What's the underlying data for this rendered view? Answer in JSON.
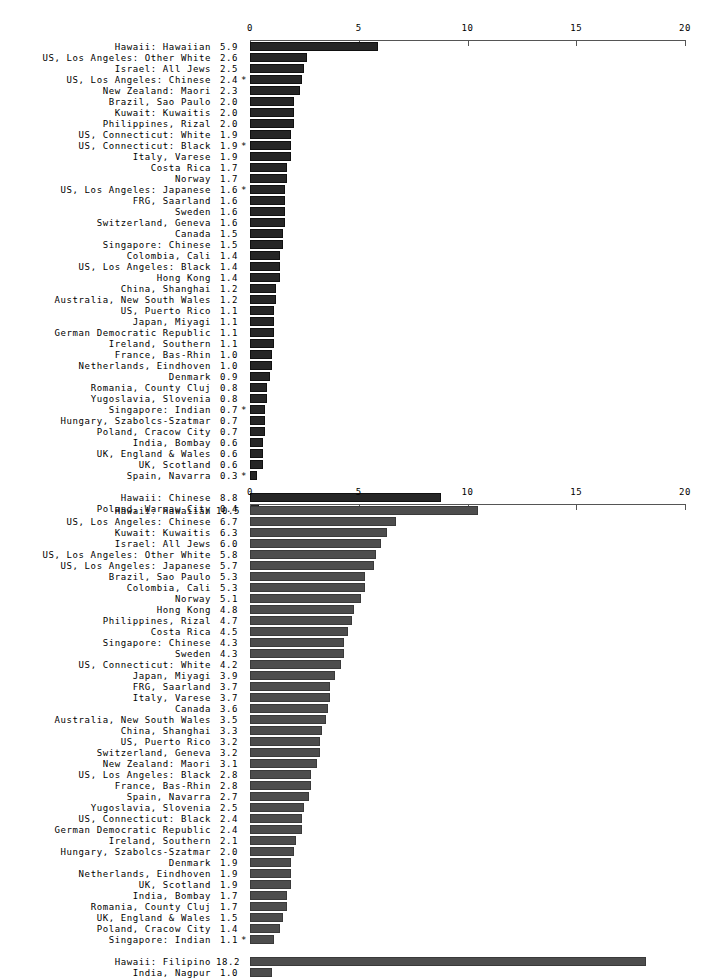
{
  "chart_data": [
    {
      "type": "bar",
      "orientation": "horizontal",
      "title": "",
      "xlabel": "",
      "ylabel": "",
      "xlim": [
        0,
        20
      ],
      "xticks": [
        0,
        5,
        10,
        15,
        20
      ],
      "xtick_labels": [
        "0",
        "5",
        "10",
        "15",
        "20"
      ],
      "grid": false,
      "bar_color": "#262626",
      "categories": [
        "Hawaii: Hawaiian",
        "US, Los Angeles: Other White",
        "Israel: All Jews",
        "US, Los Angeles: Chinese",
        "New Zealand: Maori",
        "Brazil, Sao Paulo",
        "Kuwait: Kuwaitis",
        "Philippines, Rizal",
        "US, Connecticut: White",
        "US, Connecticut: Black",
        "Italy, Varese",
        "Costa Rica",
        "Norway",
        "US, Los Angeles: Japanese",
        "FRG, Saarland",
        "Sweden",
        "Switzerland, Geneva",
        "Canada",
        "Singapore: Chinese",
        "Colombia, Cali",
        "US, Los Angeles: Black",
        "Hong Kong",
        "China, Shanghai",
        "Australia, New South Wales",
        "US, Puerto Rico",
        "Japan, Miyagi",
        "German Democratic Republic",
        "Ireland, Southern",
        "France, Bas-Rhin",
        "Netherlands, Eindhoven",
        "Denmark",
        "Romania, County Cluj",
        "Yugoslavia, Slovenia",
        "Singapore: Indian",
        "Hungary, Szabolcs-Szatmar",
        "Poland, Cracow City",
        "India, Bombay",
        "UK, England & Wales",
        "UK, Scotland",
        "Spain, Navarra",
        "Hawaii: Chinese",
        "Poland, Warsaw City"
      ],
      "values": [
        5.9,
        2.6,
        2.5,
        2.4,
        2.3,
        2.0,
        2.0,
        2.0,
        1.9,
        1.9,
        1.9,
        1.7,
        1.7,
        1.6,
        1.6,
        1.6,
        1.6,
        1.5,
        1.5,
        1.4,
        1.4,
        1.4,
        1.2,
        1.2,
        1.1,
        1.1,
        1.1,
        1.1,
        1.0,
        1.0,
        0.9,
        0.8,
        0.8,
        0.7,
        0.7,
        0.7,
        0.6,
        0.6,
        0.6,
        0.3,
        8.8,
        0.4
      ],
      "value_labels": [
        "5.9",
        "2.6",
        "2.5",
        "2.4",
        "2.3",
        "2.0",
        "2.0",
        "2.0",
        "1.9",
        "1.9",
        "1.9",
        "1.7",
        "1.7",
        "1.6",
        "1.6",
        "1.6",
        "1.6",
        "1.5",
        "1.5",
        "1.4",
        "1.4",
        "1.4",
        "1.2",
        "1.2",
        "1.1",
        "1.1",
        "1.1",
        "1.1",
        "1.0",
        "1.0",
        "0.9",
        "0.8",
        "0.8",
        "0.7",
        "0.7",
        "0.7",
        "0.6",
        "0.6",
        "0.6",
        "0.3",
        "8.8",
        "0.4"
      ],
      "annotations": [
        "",
        "",
        "",
        "*",
        "",
        "",
        "",
        "",
        "",
        "*",
        "",
        "",
        "",
        "*",
        "",
        "",
        "",
        "",
        "",
        "",
        "",
        "",
        "",
        "",
        "",
        "",
        "",
        "",
        "",
        "",
        "",
        "",
        "",
        "*",
        "",
        "",
        "",
        "",
        "",
        "*",
        "",
        ""
      ],
      "separator_after_index": 39
    },
    {
      "type": "bar",
      "orientation": "horizontal",
      "title": "",
      "xlabel": "",
      "ylabel": "",
      "xlim": [
        0,
        20
      ],
      "xticks": [
        0,
        5,
        10,
        15,
        20
      ],
      "xtick_labels": [
        "0",
        "5",
        "10",
        "15",
        "20"
      ],
      "grid": false,
      "bar_color": "#4d4d4d",
      "categories": [
        "Hawaii: Hawaiian",
        "US, Los Angeles: Chinese",
        "Kuwait: Kuwaitis",
        "Israel: All Jews",
        "US, Los Angeles: Other White",
        "US, Los Angeles: Japanese",
        "Brazil, Sao Paulo",
        "Colombia, Cali",
        "Norway",
        "Hong Kong",
        "Philippines, Rizal",
        "Costa Rica",
        "Singapore: Chinese",
        "Sweden",
        "US, Connecticut: White",
        "Japan, Miyagi",
        "FRG, Saarland",
        "Italy, Varese",
        "Canada",
        "Australia, New South Wales",
        "China, Shanghai",
        "US, Puerto Rico",
        "Switzerland, Geneva",
        "New Zealand: Maori",
        "US, Los Angeles: Black",
        "France, Bas-Rhin",
        "Spain, Navarra",
        "Yugoslavia, Slovenia",
        "US, Connecticut: Black",
        "German Democratic Republic",
        "Ireland, Southern",
        "Hungary, Szabolcs-Szatmar",
        "Denmark",
        "Netherlands, Eindhoven",
        "UK, Scotland",
        "India, Bombay",
        "Romania, County Cluj",
        "UK, England & Wales",
        "Poland, Cracow City",
        "Singapore: Indian",
        "Hawaii: Filipino",
        "India, Nagpur"
      ],
      "values": [
        10.5,
        6.7,
        6.3,
        6.0,
        5.8,
        5.7,
        5.3,
        5.3,
        5.1,
        4.8,
        4.7,
        4.5,
        4.3,
        4.3,
        4.2,
        3.9,
        3.7,
        3.7,
        3.6,
        3.5,
        3.3,
        3.2,
        3.2,
        3.1,
        2.8,
        2.8,
        2.7,
        2.5,
        2.4,
        2.4,
        2.1,
        2.0,
        1.9,
        1.9,
        1.9,
        1.7,
        1.7,
        1.5,
        1.4,
        1.1,
        18.2,
        1.0
      ],
      "value_labels": [
        "10.5",
        "6.7",
        "6.3",
        "6.0",
        "5.8",
        "5.7",
        "5.3",
        "5.3",
        "5.1",
        "4.8",
        "4.7",
        "4.5",
        "4.3",
        "4.3",
        "4.2",
        "3.9",
        "3.7",
        "3.7",
        "3.6",
        "3.5",
        "3.3",
        "3.2",
        "3.2",
        "3.1",
        "2.8",
        "2.8",
        "2.7",
        "2.5",
        "2.4",
        "2.4",
        "2.1",
        "2.0",
        "1.9",
        "1.9",
        "1.9",
        "1.7",
        "1.7",
        "1.5",
        "1.4",
        "1.1",
        "18.2",
        "1.0"
      ],
      "annotations": [
        "",
        "",
        "",
        "",
        "",
        "",
        "",
        "",
        "",
        "",
        "",
        "",
        "",
        "",
        "",
        "",
        "",
        "",
        "",
        "",
        "",
        "",
        "",
        "",
        "",
        "",
        "",
        "",
        "",
        "",
        "",
        "",
        "",
        "",
        "",
        "",
        "",
        "",
        "",
        "*",
        "",
        ""
      ],
      "separator_after_index": 39
    }
  ]
}
